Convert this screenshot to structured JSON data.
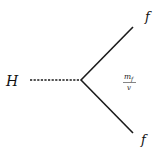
{
  "diagram": {
    "type": "feynman-vertex",
    "colors": {
      "line": "#1a1a1a",
      "text": "#111111",
      "background": "#ffffff"
    },
    "scalar_line": {
      "label": "H",
      "style": "dashed"
    },
    "fermion_lines": [
      {
        "label": "f",
        "position": "upper-right",
        "style": "solid"
      },
      {
        "label": "f",
        "position": "lower-right",
        "style": "solid"
      }
    ],
    "coupling": {
      "numerator": "m",
      "numerator_sub": "f",
      "denominator": "v"
    }
  }
}
